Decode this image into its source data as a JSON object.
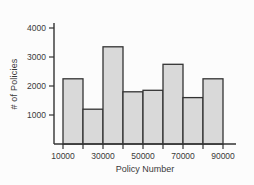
{
  "chart_data": {
    "type": "bar",
    "subtype": "histogram",
    "title": "",
    "xlabel": "Policy Number",
    "ylabel": "# of Policies",
    "bin_width": 10000,
    "categories": [
      "10000-20000",
      "20000-30000",
      "30000-40000",
      "40000-50000",
      "50000-60000",
      "60000-70000",
      "70000-80000",
      "80000-90000"
    ],
    "values": [
      2250,
      1200,
      3350,
      1800,
      1850,
      2750,
      1600,
      2250
    ],
    "x_ticks": [
      10000,
      20000,
      30000,
      40000,
      50000,
      60000,
      70000,
      80000,
      90000
    ],
    "x_tick_labels": [
      "10000",
      "30000",
      "50000",
      "70000",
      "90000"
    ],
    "y_ticks": [
      1000,
      2000,
      3000,
      4000
    ],
    "xlim": [
      10000,
      90000
    ],
    "ylim": [
      0,
      4200
    ],
    "grid": false,
    "legend": "none",
    "colors": {
      "bar_fill": "#d9d9d9",
      "bar_stroke": "#333333",
      "axis": "#333333",
      "text": "#3a3a3a",
      "background": "#fcfcfc"
    }
  }
}
